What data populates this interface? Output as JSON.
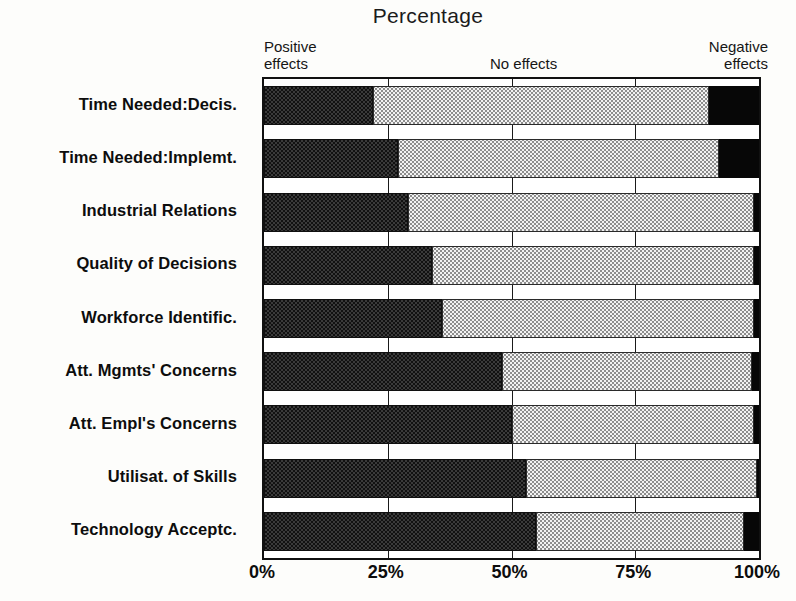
{
  "title": "Percentage",
  "legend": {
    "positive": "Positive\neffects",
    "none": "No effects",
    "negative": "Negative\neffects"
  },
  "chart_data": {
    "type": "bar",
    "orientation": "horizontal",
    "stacked": true,
    "title": "Percentage",
    "xlabel": "Percentage",
    "ylabel": "",
    "xlim": [
      0,
      100
    ],
    "xticks": [
      "0%",
      "25%",
      "50%",
      "75%",
      "100%"
    ],
    "xtick_values": [
      0,
      25,
      50,
      75,
      100
    ],
    "grid": true,
    "legend_position": "top",
    "categories": [
      "Time Needed:Decis.",
      "Time Needed:Implemt.",
      "Industrial Relations",
      "Quality of Decisions",
      "Workforce Identific.",
      "Att. Mgmts' Concerns",
      "Att. Empl's Concerns",
      "Utilisat. of Skills",
      "Technology Acceptc."
    ],
    "series": [
      {
        "name": "Positive effects",
        "values": [
          22,
          27,
          29,
          34,
          36,
          48,
          50,
          53,
          55
        ]
      },
      {
        "name": "No effects",
        "values": [
          68,
          65,
          70,
          65,
          63,
          50.5,
          49,
          46.5,
          42
        ]
      },
      {
        "name": "Negative effects",
        "values": [
          10,
          8,
          1,
          1,
          1,
          1.5,
          1,
          0.5,
          3
        ]
      }
    ]
  }
}
